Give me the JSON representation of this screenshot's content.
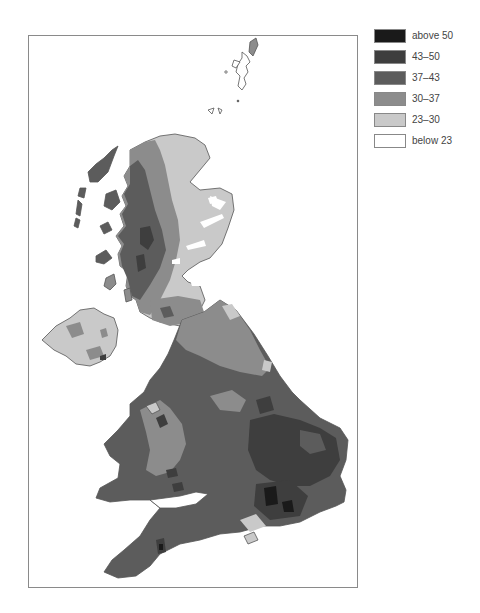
{
  "legend": {
    "items": [
      {
        "label": "above 50",
        "color": "#1a1a1a"
      },
      {
        "label": "43–50",
        "color": "#3e3e3e"
      },
      {
        "label": "37–43",
        "color": "#5c5c5c"
      },
      {
        "label": "30–37",
        "color": "#8c8c8c"
      },
      {
        "label": "23–30",
        "color": "#c9c9c9"
      },
      {
        "label": "below 23",
        "color": "#ffffff"
      }
    ]
  },
  "map": {
    "region": "United Kingdom",
    "classes": [
      "above 50",
      "43–50",
      "37–43",
      "30–37",
      "23–30",
      "below 23"
    ]
  }
}
